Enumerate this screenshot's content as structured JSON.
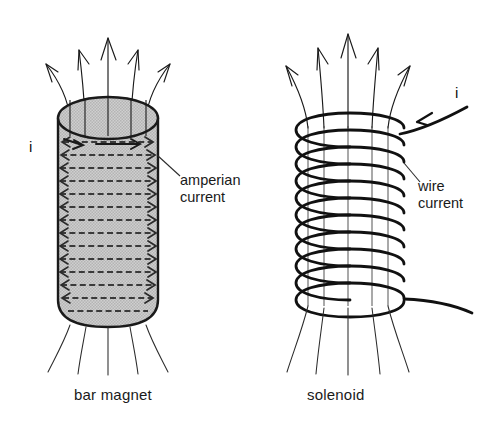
{
  "figure": {
    "type": "physics-diagram",
    "background_color": "#ffffff",
    "stroke_color": "#1a1a1a",
    "magnet_fill_color": "#c9c9c9"
  },
  "panels": [
    {
      "id": "bar-magnet",
      "caption": "bar magnet",
      "current_label": "i",
      "annotation": {
        "line1": "amperian",
        "line2": "current"
      }
    },
    {
      "id": "solenoid",
      "caption": "solenoid",
      "current_label": "i",
      "annotation": {
        "line1": "wire",
        "line2": "current"
      }
    }
  ],
  "elements": {
    "field_lines_top_count": 5,
    "field_lines_bottom_count": 5,
    "amperian_loop_rows": 14,
    "solenoid_turns": 11
  }
}
